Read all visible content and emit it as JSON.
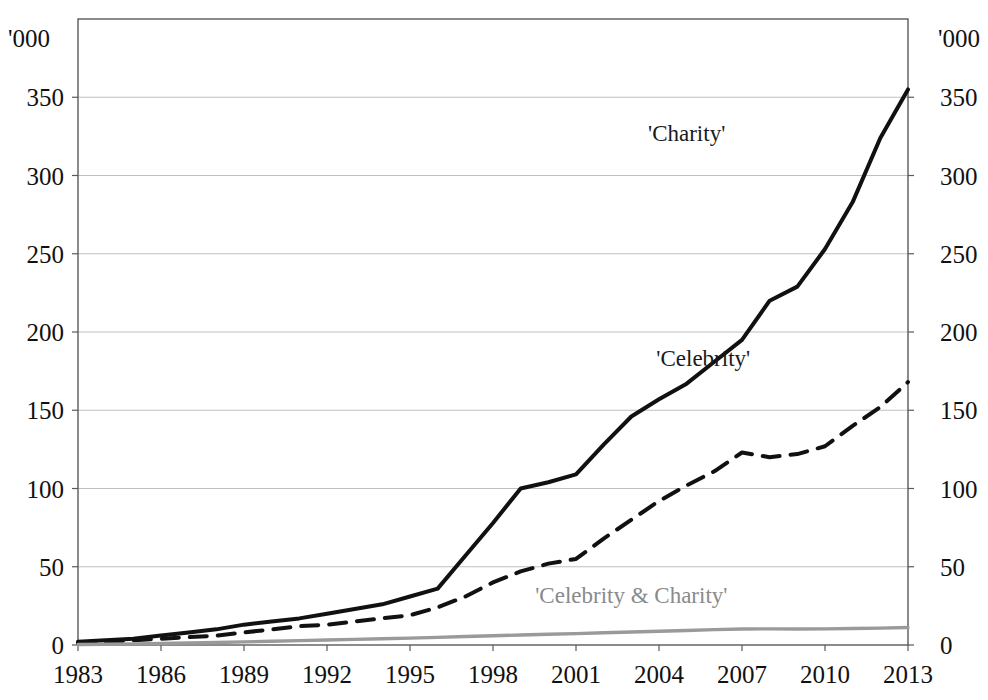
{
  "chart_data": {
    "type": "line",
    "title": "",
    "subtitle": "",
    "xlabel": "",
    "ylabel": "'000",
    "ylabel_right": "'000",
    "xlim": [
      1983,
      2013
    ],
    "ylim": [
      0,
      375
    ],
    "grid": true,
    "grid_axis": "y",
    "legend": "inline-annotations",
    "legend_position": "on-plot",
    "y_ticks": [
      0,
      50,
      100,
      150,
      200,
      250,
      300,
      350
    ],
    "y_tick_labels": [
      "0",
      "50",
      "100",
      "150",
      "200",
      "250",
      "300",
      "350"
    ],
    "y_ticks_right": [
      0,
      50,
      100,
      150,
      200,
      250,
      300,
      350
    ],
    "y_tick_labels_right": [
      "0",
      "50",
      "100",
      "150",
      "200",
      "250",
      "300",
      "350"
    ],
    "x_ticks": [
      1983,
      1986,
      1989,
      1992,
      1995,
      1998,
      2001,
      2004,
      2007,
      2010,
      2013
    ],
    "x_tick_labels": [
      "1983",
      "1986",
      "1989",
      "1992",
      "1995",
      "1998",
      "2001",
      "2004",
      "2007",
      "2010",
      "2013"
    ],
    "x": [
      1983,
      1984,
      1985,
      1986,
      1987,
      1988,
      1989,
      1990,
      1991,
      1992,
      1993,
      1994,
      1995,
      1996,
      1997,
      1998,
      1999,
      2000,
      2001,
      2002,
      2003,
      2004,
      2005,
      2006,
      2007,
      2008,
      2009,
      2010,
      2011,
      2012,
      2013
    ],
    "series": [
      {
        "name": "'Charity'",
        "label": "'Charity'",
        "color": "#111111",
        "style": "solid",
        "width": 4,
        "label_x": 2005.0,
        "label_y": 322,
        "values": [
          1,
          2,
          3,
          4,
          6,
          8,
          11,
          14,
          17,
          20,
          22,
          25,
          29,
          33,
          47,
          66,
          90,
          101,
          104,
          108,
          110,
          128,
          144,
          157,
          163,
          170,
          181,
          194,
          206,
          221,
          231
        ]
      },
      {
        "name": "'Celebrity'",
        "label": "'Celebrity'",
        "color": "#111111",
        "style": "dashed",
        "width": 4,
        "label_x": 2005.6,
        "label_y": 178,
        "values": [
          1,
          1,
          2,
          3,
          4,
          5,
          7,
          8,
          10,
          12,
          14,
          16,
          19,
          22,
          27,
          34,
          42,
          50,
          53,
          62,
          73,
          84,
          95,
          107,
          118,
          123,
          120,
          122,
          126,
          136,
          148
        ]
      },
      {
        "name": "'Celebrity & Charity'",
        "label": "'Celebrity & Charity'",
        "color": "#9a9a9a",
        "style": "solid",
        "width": 3.4,
        "label_x": 2003.0,
        "label_y": 27,
        "values": [
          0.3,
          0.4,
          0.5,
          0.7,
          0.9,
          1.1,
          1.4,
          1.7,
          2.0,
          2.3,
          2.6,
          3.0,
          3.4,
          3.8,
          4.3,
          4.8,
          5.4,
          6.0,
          6.6,
          7.2,
          7.8,
          8.4,
          9.0,
          9.6,
          10.1,
          10.3,
          10.3,
          10.4,
          10.6,
          10.8,
          11.0
        ]
      }
    ],
    "series_override_points": {
      "'Charity'": [
        [
          1983,
          2
        ],
        [
          1984,
          3
        ],
        [
          1985,
          4
        ],
        [
          1986,
          6
        ],
        [
          1987,
          8
        ],
        [
          1988,
          10
        ],
        [
          1989,
          13
        ],
        [
          1990,
          15
        ],
        [
          1991,
          17
        ],
        [
          1992,
          20
        ],
        [
          1993,
          23
        ],
        [
          1994,
          26
        ],
        [
          1995,
          31
        ],
        [
          1996,
          36
        ],
        [
          1997,
          57
        ],
        [
          1998,
          78
        ],
        [
          1999,
          100
        ],
        [
          2000,
          104
        ],
        [
          2001,
          109
        ],
        [
          2002,
          128
        ],
        [
          2003,
          146
        ],
        [
          2004,
          157
        ],
        [
          2005,
          167
        ],
        [
          2006,
          181
        ],
        [
          2007,
          195
        ],
        [
          2008,
          220
        ],
        [
          2009,
          229
        ],
        [
          2010,
          253
        ],
        [
          2011,
          283
        ],
        [
          2012,
          324
        ],
        [
          2013,
          355
        ]
      ],
      "'Celebrity'": [
        [
          1983,
          1
        ],
        [
          1984,
          2
        ],
        [
          1985,
          3
        ],
        [
          1986,
          4
        ],
        [
          1987,
          5
        ],
        [
          1988,
          6
        ],
        [
          1989,
          8
        ],
        [
          1990,
          10
        ],
        [
          1991,
          12
        ],
        [
          1992,
          13
        ],
        [
          1993,
          15
        ],
        [
          1994,
          17
        ],
        [
          1995,
          19
        ],
        [
          1996,
          24
        ],
        [
          1997,
          31
        ],
        [
          1998,
          40
        ],
        [
          1999,
          47
        ],
        [
          2000,
          52
        ],
        [
          2001,
          55
        ],
        [
          2002,
          68
        ],
        [
          2003,
          80
        ],
        [
          2004,
          92
        ],
        [
          2005,
          102
        ],
        [
          2006,
          111
        ],
        [
          2007,
          123
        ],
        [
          2008,
          120
        ],
        [
          2009,
          122
        ],
        [
          2010,
          127
        ],
        [
          2011,
          140
        ],
        [
          2012,
          152
        ],
        [
          2013,
          168
        ]
      ],
      "'Celebrity & Charity'": [
        [
          1983,
          0.3
        ],
        [
          1984,
          0.5
        ],
        [
          1985,
          0.7
        ],
        [
          1986,
          1.0
        ],
        [
          1987,
          1.3
        ],
        [
          1988,
          1.6
        ],
        [
          1989,
          2.0
        ],
        [
          1990,
          2.4
        ],
        [
          1991,
          2.8
        ],
        [
          1992,
          3.2
        ],
        [
          1993,
          3.6
        ],
        [
          1994,
          4.0
        ],
        [
          1995,
          4.4
        ],
        [
          1996,
          4.9
        ],
        [
          1997,
          5.4
        ],
        [
          1998,
          5.9
        ],
        [
          1999,
          6.4
        ],
        [
          2000,
          6.9
        ],
        [
          2001,
          7.3
        ],
        [
          2002,
          7.8
        ],
        [
          2003,
          8.3
        ],
        [
          2004,
          8.8
        ],
        [
          2005,
          9.3
        ],
        [
          2006,
          9.8
        ],
        [
          2007,
          10.2
        ],
        [
          2008,
          10.3
        ],
        [
          2009,
          10.2
        ],
        [
          2010,
          10.3
        ],
        [
          2011,
          10.5
        ],
        [
          2012,
          10.8
        ],
        [
          2013,
          11.2
        ]
      ]
    }
  },
  "geometry": {
    "plot_left": 78,
    "plot_right": 908,
    "plot_top": 19,
    "plot_bottom": 645,
    "y_value_at_top": 400,
    "pixels_per_50": 78.3
  }
}
